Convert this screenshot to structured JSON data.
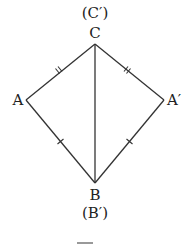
{
  "diagram": {
    "type": "kite-reflection",
    "points": {
      "C": {
        "label": "C",
        "alt_label": "(C′)",
        "x": 95,
        "y": 44
      },
      "A": {
        "label": "A",
        "x": 26,
        "y": 100
      },
      "A_prime": {
        "label": "A′",
        "x": 164,
        "y": 100
      },
      "B": {
        "label": "B",
        "alt_label": "(B′)",
        "x": 95,
        "y": 183
      }
    },
    "edges": [
      {
        "from": "C",
        "to": "A",
        "marks": 2
      },
      {
        "from": "C",
        "to": "A_prime",
        "marks": 2
      },
      {
        "from": "A",
        "to": "B",
        "marks": 1
      },
      {
        "from": "A_prime",
        "to": "B",
        "marks": 1
      },
      {
        "from": "C",
        "to": "B",
        "marks": 0
      }
    ],
    "colors": {
      "stroke": "#333333",
      "text": "#222222",
      "background": "#ffffff"
    }
  }
}
